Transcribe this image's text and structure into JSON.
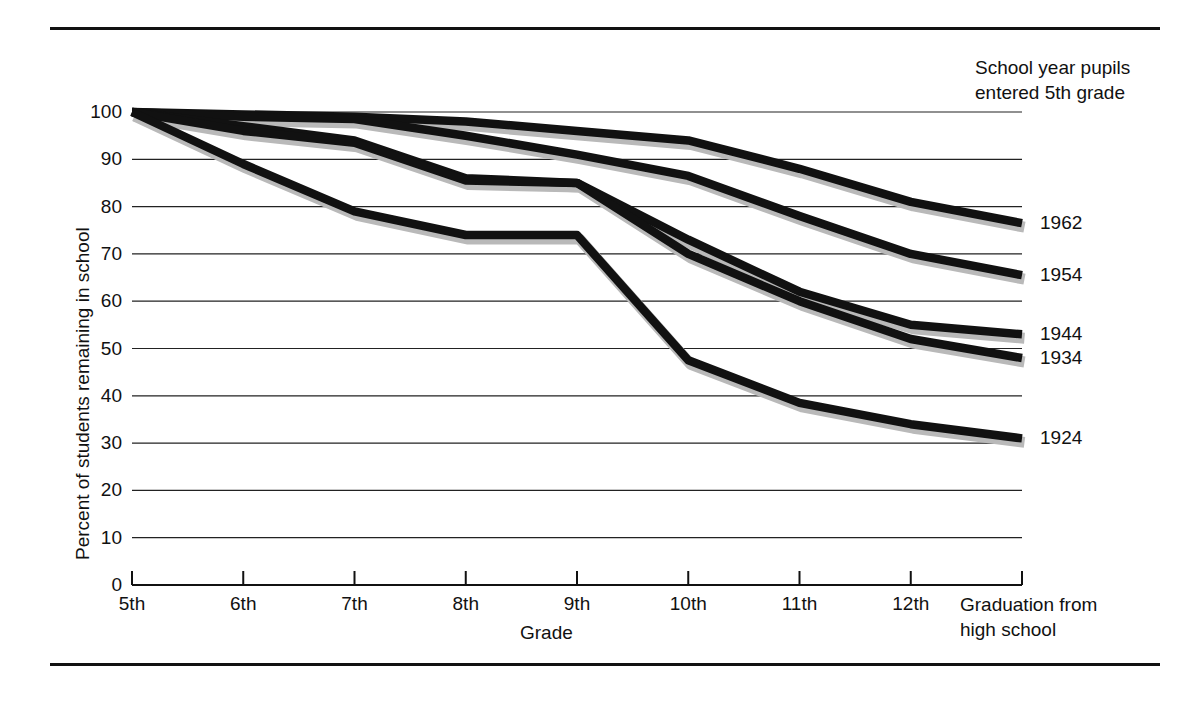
{
  "figure": {
    "has_top_rule": true,
    "has_bottom_rule": true,
    "rule_color": "#111111"
  },
  "legend": {
    "title_line1": "School year pupils",
    "title_line2": "entered 5th grade"
  },
  "axis": {
    "ylabel": "Percent of students remaining in school",
    "xlabel": "Grade",
    "yticks": [
      "100",
      "90",
      "80",
      "70",
      "60",
      "50",
      "40",
      "30",
      "20",
      "10",
      "0"
    ],
    "xticks": [
      "5th",
      "6th",
      "7th",
      "8th",
      "9th",
      "10th",
      "11th",
      "12th"
    ],
    "xtick_last_line1": "Graduation from",
    "xtick_last_line2": "high school"
  },
  "chart_data": {
    "type": "line",
    "title": "",
    "xlabel": "Grade",
    "ylabel": "Percent of students remaining in school",
    "categories": [
      "5th",
      "6th",
      "7th",
      "8th",
      "9th",
      "10th",
      "11th",
      "12th",
      "Graduation from high school"
    ],
    "ylim": [
      0,
      100
    ],
    "xlim_categories": 9,
    "grid": "horizontal",
    "legend_position": "right-end-labels",
    "legend_title": "School year pupils entered 5th grade",
    "series": [
      {
        "name": "1962",
        "values": [
          100,
          99.5,
          99,
          98,
          96,
          94,
          88,
          81,
          76.5
        ],
        "color": "#111111"
      },
      {
        "name": "1954",
        "values": [
          100,
          99,
          98.5,
          95,
          91,
          86.5,
          78,
          70,
          65.5
        ],
        "color": "#111111"
      },
      {
        "name": "1944",
        "values": [
          100,
          97,
          94,
          86,
          85,
          73,
          62,
          55,
          53
        ],
        "color": "#111111"
      },
      {
        "name": "1934",
        "values": [
          100,
          96,
          93.5,
          85.5,
          85,
          70,
          60,
          52,
          48
        ],
        "color": "#111111"
      },
      {
        "name": "1924",
        "values": [
          100,
          89,
          79,
          74,
          74,
          47.5,
          38.5,
          34,
          31
        ],
        "color": "#111111"
      }
    ]
  }
}
